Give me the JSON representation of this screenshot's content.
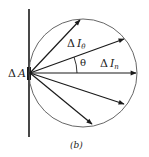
{
  "diagram": {
    "caption": "(b)",
    "labels": {
      "area": "ΔA",
      "area_delta": "Δ",
      "area_var": "A",
      "oblique_delta": "Δ",
      "oblique_var": "I",
      "oblique_sub": "θ",
      "normal_delta": "Δ",
      "normal_var": "I",
      "normal_sub": "n",
      "angle": "θ"
    },
    "colors": {
      "line": "#1a1a1a",
      "circle": "#555555"
    }
  }
}
